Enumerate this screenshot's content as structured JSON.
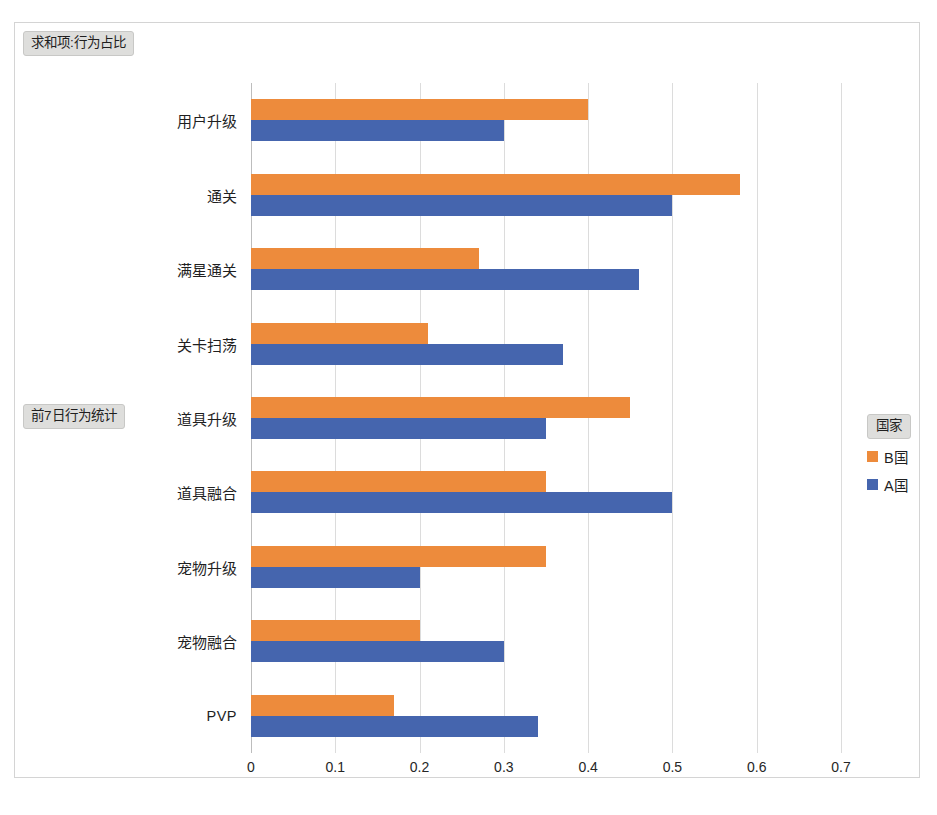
{
  "frame": {
    "sum_field_label": "求和项:行为占比",
    "row_field_label": "前7日行为统计"
  },
  "legend": {
    "title": "国家",
    "items": [
      {
        "label": "B国",
        "color": "#ED8B3C"
      },
      {
        "label": "A国",
        "color": "#4565AE"
      }
    ]
  },
  "axis": {
    "tick_labels": [
      "0",
      "0.1",
      "0.2",
      "0.3",
      "0.4",
      "0.5",
      "0.6",
      "0.7"
    ]
  },
  "chart_data": {
    "type": "bar",
    "orientation": "horizontal",
    "title": "求和项:行为占比",
    "xlabel": "",
    "ylabel": "前7日行为统计",
    "xlim": [
      0,
      0.7
    ],
    "xticks": [
      0,
      0.1,
      0.2,
      0.3,
      0.4,
      0.5,
      0.6,
      0.7
    ],
    "grid": "vertical",
    "legend_position": "right",
    "legend_title": "国家",
    "categories": [
      "用户升级",
      "通关",
      "满星通关",
      "关卡扫荡",
      "道具升级",
      "道具融合",
      "宠物升级",
      "宠物融合",
      "PVP"
    ],
    "series": [
      {
        "name": "B国",
        "color": "#ED8B3C",
        "values": [
          0.4,
          0.58,
          0.27,
          0.21,
          0.45,
          0.35,
          0.35,
          0.2,
          0.17
        ]
      },
      {
        "name": "A国",
        "color": "#4565AE",
        "values": [
          0.3,
          0.5,
          0.46,
          0.37,
          0.35,
          0.5,
          0.2,
          0.3,
          0.34
        ]
      }
    ]
  }
}
